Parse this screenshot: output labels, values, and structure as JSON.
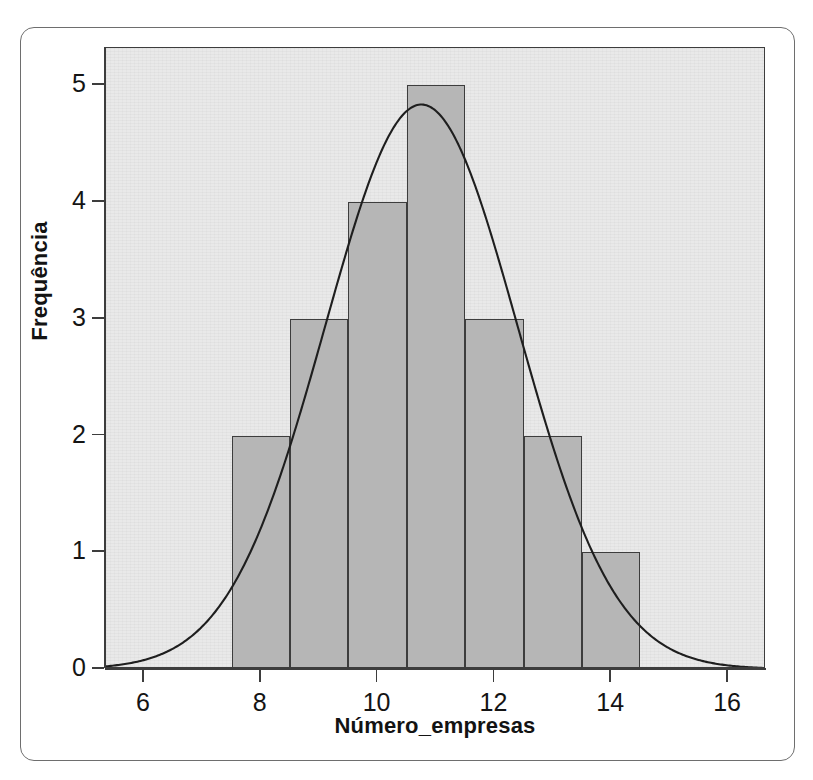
{
  "figure": {
    "background_color": "#ffffff",
    "frame_color": "#6e6e6e",
    "plot_background_color": "#e9e9e9",
    "axis_color": "#3d3d3d",
    "bar_fill_color": "#b6b6b6",
    "bar_edge_color": "#3d3d3d",
    "curve_color": "#1e1e1e"
  },
  "chart_data": {
    "type": "bar",
    "title": "",
    "subtitle": "",
    "xlabel": "Número_empresas",
    "ylabel": "Frequência",
    "xlim": [
      5.35,
      16.65
    ],
    "ylim": [
      0,
      5.32
    ],
    "grid": false,
    "legend": null,
    "bin_width": 1,
    "bin_edges": [
      7.5,
      8.5,
      9.5,
      10.5,
      11.5,
      12.5,
      13.5,
      14.5
    ],
    "categories": [
      "7.5-8.5",
      "8.5-9.5",
      "9.5-10.5",
      "10.5-11.5",
      "11.5-12.5",
      "12.5-13.5",
      "13.5-14.5"
    ],
    "bin_centers": [
      8,
      9,
      10,
      11,
      12,
      13,
      14
    ],
    "values": [
      2,
      3,
      4,
      5,
      3,
      2,
      1
    ],
    "x_ticks": [
      6,
      8,
      10,
      12,
      14,
      16
    ],
    "x_tick_labels": [
      "6",
      "8",
      "10",
      "12",
      "14",
      "16"
    ],
    "y_ticks": [
      0,
      1,
      2,
      3,
      4,
      5
    ],
    "y_tick_labels": [
      "0",
      "1",
      "2",
      "3",
      "4",
      "5"
    ],
    "overlay": {
      "type": "line",
      "name": "normal-curve",
      "mean": 10.75,
      "std_dev": 1.65,
      "n": 20,
      "peak_value": 4.84,
      "peak_x": 10.75
    }
  },
  "axes": {
    "x_title": "Número_empresas",
    "y_title": "Frequência",
    "x_tick_labels": [
      "6",
      "8",
      "10",
      "12",
      "14",
      "16"
    ],
    "y_tick_labels": [
      "0",
      "1",
      "2",
      "3",
      "4",
      "5"
    ]
  }
}
